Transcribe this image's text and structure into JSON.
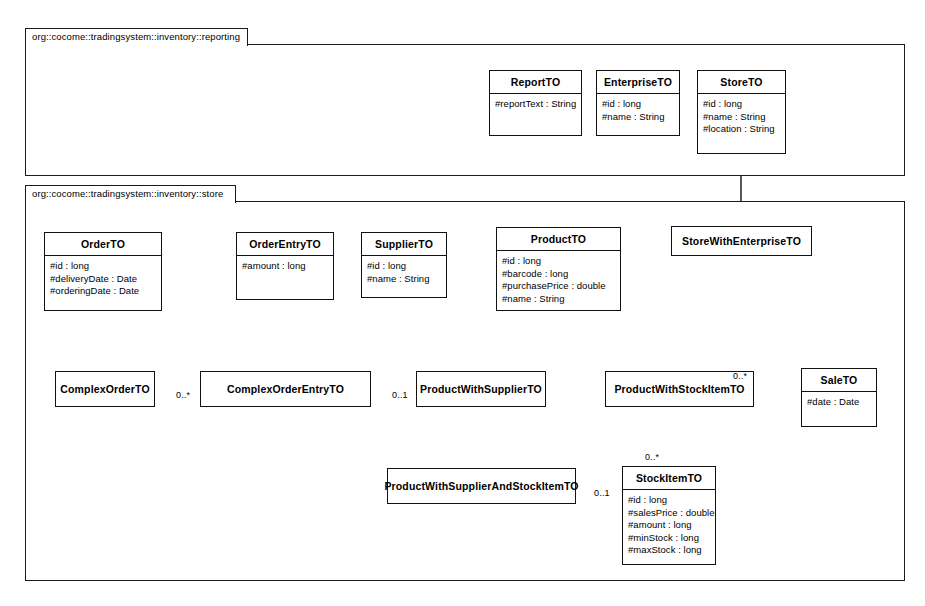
{
  "diagram": {
    "kind": "uml-class-diagram",
    "background": "#ffffff",
    "line_color": "#111111"
  },
  "packages": [
    {
      "id": "pkg-reporting",
      "label": "org::cocome::tradingsystem::inventory::reporting"
    },
    {
      "id": "pkg-store",
      "label": "org::cocome::tradingsystem::inventory::store"
    }
  ],
  "classes": [
    {
      "id": "ReportTO",
      "name": "ReportTO",
      "attributes": [
        "#reportText : String"
      ]
    },
    {
      "id": "EnterpriseTO",
      "name": "EnterpriseTO",
      "attributes": [
        "#id : long",
        "#name : String"
      ]
    },
    {
      "id": "StoreTO",
      "name": "StoreTO",
      "attributes": [
        "#id : long",
        "#name : String",
        "#location : String"
      ]
    },
    {
      "id": "StoreWithEnterpriseTO",
      "name": "StoreWithEnterpriseTO",
      "attributes": []
    },
    {
      "id": "OrderTO",
      "name": "OrderTO",
      "attributes": [
        "#id : long",
        "#deliveryDate : Date",
        "#orderingDate : Date"
      ]
    },
    {
      "id": "OrderEntryTO",
      "name": "OrderEntryTO",
      "attributes": [
        "#amount : long"
      ]
    },
    {
      "id": "SupplierTO",
      "name": "SupplierTO",
      "attributes": [
        "#id : long",
        "#name : String"
      ]
    },
    {
      "id": "ProductTO",
      "name": "ProductTO",
      "attributes": [
        "#id : long",
        "#barcode : long",
        "#purchasePrice : double",
        "#name : String"
      ]
    },
    {
      "id": "ComplexOrderTO",
      "name": "ComplexOrderTO",
      "attributes": []
    },
    {
      "id": "ComplexOrderEntryTO",
      "name": "ComplexOrderEntryTO",
      "attributes": []
    },
    {
      "id": "ProductWithSupplierTO",
      "name": "ProductWithSupplierTO",
      "attributes": []
    },
    {
      "id": "ProductWithStockItemTO",
      "name": "ProductWithStockItemTO",
      "attributes": []
    },
    {
      "id": "SaleTO",
      "name": "SaleTO",
      "attributes": [
        "#date : Date"
      ]
    },
    {
      "id": "ProductWithSupplierAndStockItemTO",
      "name": "ProductWithSupplierAndStockItemTO",
      "attributes": []
    },
    {
      "id": "StockItemTO",
      "name": "StockItemTO",
      "attributes": [
        "#id : long",
        "#salesPrice : double",
        "#amount : long",
        "#minStock : long",
        "#maxStock : long"
      ]
    }
  ],
  "relations": [
    {
      "id": "gen-store-with-enterprise",
      "type": "generalization",
      "from": "StoreWithEnterpriseTO",
      "to": "StoreTO",
      "multiplicity": ""
    },
    {
      "id": "gen-complex-order",
      "type": "generalization",
      "from": "ComplexOrderTO",
      "to": "OrderTO",
      "multiplicity": ""
    },
    {
      "id": "gen-complex-order-entry",
      "type": "generalization",
      "from": "ComplexOrderEntryTO",
      "to": "OrderEntryTO",
      "multiplicity": ""
    },
    {
      "id": "gen-product-with-supplier",
      "type": "generalization",
      "from": "ProductWithSupplierTO",
      "to": "ProductTO",
      "multiplicity": ""
    },
    {
      "id": "gen-product-with-stockitem",
      "type": "generalization",
      "from": "ProductWithStockItemTO",
      "to": "ProductTO",
      "multiplicity": ""
    },
    {
      "id": "gen-product-with-supplier-and-stockitem",
      "type": "generalization",
      "from": "ProductWithSupplierAndStockItemTO",
      "to": "ProductWithSupplierTO",
      "multiplicity": ""
    },
    {
      "id": "assoc-order-to-entry",
      "type": "association",
      "from": "ComplexOrderTO",
      "to": "ComplexOrderEntryTO",
      "multiplicity": "0..*"
    },
    {
      "id": "assoc-entry-to-product-supplier",
      "type": "association",
      "from": "ComplexOrderEntryTO",
      "to": "ProductWithSupplierTO",
      "multiplicity": "0..1"
    },
    {
      "id": "assoc-sale-to-product-stockitem",
      "type": "association",
      "from": "SaleTO",
      "to": "ProductWithStockItemTO",
      "multiplicity": "0..*"
    },
    {
      "id": "assoc-product-stockitem-to-stockitem",
      "type": "association",
      "from": "ProductWithStockItemTO",
      "to": "StockItemTO",
      "multiplicity": "0..*"
    },
    {
      "id": "assoc-pwsasi-to-stockitem",
      "type": "association",
      "from": "ProductWithSupplierAndStockItemTO",
      "to": "StockItemTO",
      "multiplicity": "0..1"
    }
  ],
  "multiplicity_labels": [
    {
      "id": "mult-order-entry",
      "text": "0..*"
    },
    {
      "id": "mult-entry-product",
      "text": "0..1"
    },
    {
      "id": "mult-sale-product",
      "text": "0..*"
    },
    {
      "id": "mult-stockitem-top",
      "text": "0..*"
    },
    {
      "id": "mult-pwsasi-stockitem",
      "text": "0..1"
    }
  ]
}
